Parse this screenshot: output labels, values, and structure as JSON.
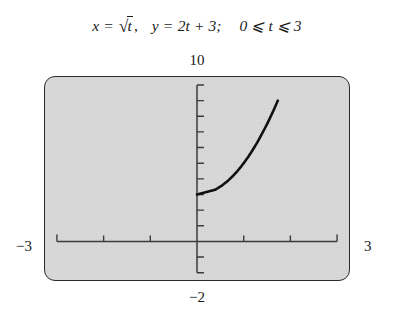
{
  "caption": {
    "x_lhs": "x",
    "eq1": "=",
    "radical_symbol": "√",
    "radical_body": "t",
    "comma": ",",
    "y_lhs": "y",
    "eq2": "=",
    "y_rhs": "2t + 3;",
    "domain": "0 ⩽ t ⩽ 3",
    "full_text": "x = √t,  y = 2t + 3;  0 ⩽ t ⩽ 3"
  },
  "axes": {
    "ymax_label": "10",
    "ymin_label": "−2",
    "xmin_label": "−3",
    "xmax_label": "3"
  },
  "chart_data": {
    "type": "line",
    "xlabel": "x",
    "ylabel": "y",
    "xlim": [
      -3,
      3
    ],
    "ylim": [
      -2,
      10
    ],
    "grid": false,
    "legend": "none",
    "x_tick_labels": [
      "−3",
      "3"
    ],
    "y_tick_labels": [
      "−2",
      "10"
    ],
    "x_ticks": [
      -3,
      -2,
      -1,
      1,
      2,
      3
    ],
    "y_ticks": [
      -2,
      -1,
      1,
      2,
      3,
      4,
      5,
      6,
      7,
      8,
      9,
      10
    ],
    "x_tick_interval": 1,
    "y_tick_interval": 1,
    "parameter": {
      "name": "t",
      "min": 0,
      "max": 3,
      "x_of_t": "sqrt(t)",
      "y_of_t": "2t + 3"
    },
    "series": [
      {
        "name": "x = √t, y = 2t + 3",
        "color": "#111111",
        "linewidth": 2.6,
        "points": [
          {
            "t": 0.0,
            "x": 0.0,
            "y": 3.0
          },
          {
            "t": 0.15,
            "x": 0.387,
            "y": 3.3
          },
          {
            "t": 0.3,
            "x": 0.548,
            "y": 3.6
          },
          {
            "t": 0.45,
            "x": 0.671,
            "y": 3.9
          },
          {
            "t": 0.6,
            "x": 0.775,
            "y": 4.2
          },
          {
            "t": 0.75,
            "x": 0.866,
            "y": 4.5
          },
          {
            "t": 0.9,
            "x": 0.949,
            "y": 4.8
          },
          {
            "t": 1.05,
            "x": 1.025,
            "y": 5.1
          },
          {
            "t": 1.2,
            "x": 1.095,
            "y": 5.4
          },
          {
            "t": 1.35,
            "x": 1.162,
            "y": 5.7
          },
          {
            "t": 1.5,
            "x": 1.225,
            "y": 6.0
          },
          {
            "t": 1.65,
            "x": 1.285,
            "y": 6.3
          },
          {
            "t": 1.8,
            "x": 1.342,
            "y": 6.6
          },
          {
            "t": 1.95,
            "x": 1.396,
            "y": 6.9
          },
          {
            "t": 2.1,
            "x": 1.449,
            "y": 7.2
          },
          {
            "t": 2.25,
            "x": 1.5,
            "y": 7.5
          },
          {
            "t": 2.4,
            "x": 1.549,
            "y": 7.8
          },
          {
            "t": 2.55,
            "x": 1.597,
            "y": 8.1
          },
          {
            "t": 2.7,
            "x": 1.643,
            "y": 8.4
          },
          {
            "t": 2.85,
            "x": 1.688,
            "y": 8.7
          },
          {
            "t": 3.0,
            "x": 1.732,
            "y": 9.0
          }
        ]
      }
    ]
  },
  "colors": {
    "screen_background": "#d9d9d9",
    "screen_border": "#2b2b2b",
    "axis": "#3a3a3a",
    "curve": "#111111",
    "page_background": "#ffffff",
    "text": "#1a1a1a"
  }
}
